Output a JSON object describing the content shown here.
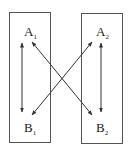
{
  "diagram": {
    "boxes": [
      {
        "id": "left",
        "nodes": [
          {
            "letter": "A",
            "sub": "1"
          },
          {
            "letter": "B",
            "sub": "1"
          }
        ]
      },
      {
        "id": "right",
        "nodes": [
          {
            "letter": "A",
            "sub": "2"
          },
          {
            "letter": "B",
            "sub": "2"
          }
        ]
      }
    ],
    "edges": [
      {
        "from": "A1",
        "to": "B1",
        "type": "bidirectional"
      },
      {
        "from": "A2",
        "to": "B2",
        "type": "bidirectional"
      },
      {
        "from": "A1",
        "to": "B2",
        "type": "bidirectional"
      },
      {
        "from": "A2",
        "to": "B1",
        "type": "bidirectional"
      }
    ],
    "colors": {
      "stroke": "#444444",
      "text": "#222222",
      "background": "#ffffff"
    }
  }
}
